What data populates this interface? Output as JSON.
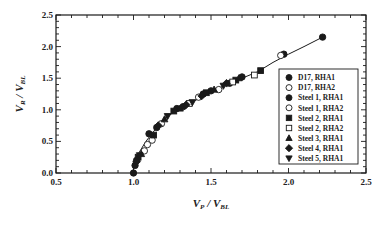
{
  "chart_data": {
    "type": "scatter",
    "title": "",
    "xlabel": "V_P / V_BL",
    "ylabel": "V_R / V_BL",
    "xlabel_parts": {
      "main": "V",
      "sub1": "P",
      "sep": " / ",
      "main2": "V",
      "sub2": "BL"
    },
    "ylabel_parts": {
      "main": "V",
      "sub1": "R",
      "sep": " / ",
      "main2": "V",
      "sub2": "BL"
    },
    "xlim": [
      0.5,
      2.5
    ],
    "ylim": [
      0.0,
      2.5
    ],
    "xticks": [
      "0.5",
      "1.0",
      "1.5",
      "2.0",
      "2.5"
    ],
    "yticks": [
      "0.0",
      "0.5",
      "1.0",
      "1.5",
      "2.0",
      "2.5"
    ],
    "grid": false,
    "legend_position": "inside right",
    "fit_line": {
      "x": [
        1.0,
        1.0,
        1.03,
        1.08,
        1.15,
        1.22,
        1.3,
        1.4,
        1.5,
        1.6,
        1.7,
        1.8,
        1.9,
        2.0,
        2.1,
        2.22
      ],
      "y": [
        0.0,
        0.1,
        0.3,
        0.5,
        0.72,
        0.9,
        1.02,
        1.15,
        1.28,
        1.4,
        1.5,
        1.6,
        1.75,
        1.88,
        2.0,
        2.15
      ]
    },
    "series": [
      {
        "name": "D17, RHA1",
        "marker": "circle",
        "filled": true,
        "points": [
          [
            1.0,
            0.0
          ],
          [
            1.02,
            0.2
          ],
          [
            1.1,
            0.62
          ],
          [
            1.28,
            1.02
          ],
          [
            1.45,
            1.25
          ],
          [
            1.62,
            1.42
          ],
          [
            1.97,
            1.88
          ],
          [
            2.22,
            2.15
          ]
        ]
      },
      {
        "name": "D17, RHA2",
        "marker": "circle",
        "filled": false,
        "points": [
          [
            1.07,
            0.35
          ],
          [
            1.12,
            0.52
          ],
          [
            1.42,
            1.2
          ],
          [
            1.95,
            1.86
          ]
        ]
      },
      {
        "name": "Steel 1, RHA1",
        "marker": "circle",
        "filled": true,
        "points": [
          [
            1.01,
            0.12
          ],
          [
            1.15,
            0.72
          ],
          [
            1.32,
            1.05
          ],
          [
            1.5,
            1.3
          ],
          [
            1.7,
            1.52
          ]
        ]
      },
      {
        "name": "Steel 1, RHA2",
        "marker": "circle",
        "filled": false,
        "points": [
          [
            1.09,
            0.45
          ],
          [
            1.18,
            0.78
          ],
          [
            1.55,
            1.32
          ]
        ]
      },
      {
        "name": "Steel 2, RHA1",
        "marker": "square",
        "filled": true,
        "points": [
          [
            1.03,
            0.25
          ],
          [
            1.13,
            0.6
          ],
          [
            1.26,
            0.98
          ],
          [
            1.47,
            1.27
          ],
          [
            1.66,
            1.47
          ],
          [
            1.82,
            1.62
          ]
        ]
      },
      {
        "name": "Steel 2, RHA2",
        "marker": "square",
        "filled": false,
        "points": [
          [
            1.36,
            1.1
          ],
          [
            1.64,
            1.44
          ],
          [
            1.78,
            1.55
          ]
        ]
      },
      {
        "name": "Steel 3, RHA1",
        "marker": "triangle-up",
        "filled": true,
        "points": [
          [
            1.05,
            0.3
          ],
          [
            1.2,
            0.85
          ],
          [
            1.3,
            1.02
          ],
          [
            1.52,
            1.32
          ],
          [
            1.68,
            1.5
          ]
        ]
      },
      {
        "name": "Steel 4, RHA1",
        "marker": "diamond",
        "filled": true,
        "points": [
          [
            1.02,
            0.18
          ],
          [
            1.16,
            0.75
          ],
          [
            1.34,
            1.08
          ],
          [
            1.44,
            1.22
          ],
          [
            1.6,
            1.42
          ]
        ]
      },
      {
        "name": "Steel 5, RHA1",
        "marker": "triangle-down",
        "filled": true,
        "points": [
          [
            1.04,
            0.28
          ],
          [
            1.22,
            0.9
          ],
          [
            1.38,
            1.12
          ],
          [
            1.58,
            1.38
          ]
        ]
      }
    ]
  },
  "legend": {
    "items": [
      {
        "label": "D17, RHA1"
      },
      {
        "label": "D17, RHA2"
      },
      {
        "label": "Steel 1, RHA1"
      },
      {
        "label": "Steel 1, RHA2"
      },
      {
        "label": "Steel 2, RHA1"
      },
      {
        "label": "Steel 2, RHA2"
      },
      {
        "label": "Steel 3, RHA1"
      },
      {
        "label": "Steel 4, RHA1"
      },
      {
        "label": "Steel 5, RHA1"
      }
    ]
  },
  "colors": {
    "ink": "#1a1a1a",
    "background": "#ffffff"
  }
}
